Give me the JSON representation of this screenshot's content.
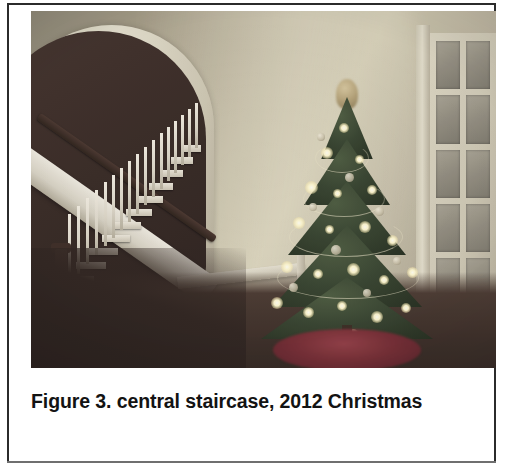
{
  "document": {
    "type": "figure-with-caption",
    "background_color": "#ffffff",
    "border_color": "#2b2b2b"
  },
  "figure": {
    "photo": {
      "alt": "Interior home photograph: central staircase with white balusters beneath an arched opening, a lit Christmas tree with a golden topper and red tree skirt, and a white French door with glass panes on the right",
      "scene": "Home interior at Christmas",
      "wall_color": "#b5ab92",
      "arch_trim_color": "#e6e1cd",
      "stair_baluster_color": "#f2ecdf",
      "handrail_color": "#3a2820",
      "floor_color": "#3b2b24",
      "tree_color": "#35432c",
      "tree_light_color": "#fff6c9",
      "tree_skirt_color": "#7c2831",
      "tree_topper_color": "#b7a273",
      "door_color": "#ddd6c0",
      "door_pane_color": "#918b7c",
      "door_pane_rows": 6,
      "door_pane_columns": 2
    },
    "caption": {
      "label": "Figure 3.",
      "text": "Figure 3. central staircase, 2012 Christmas",
      "line1": "Figure 3. central staircase, 2012",
      "line2": "Christmas",
      "figure_number": "3",
      "subject": "central staircase",
      "year": "2012",
      "occasion": "Christmas"
    }
  }
}
